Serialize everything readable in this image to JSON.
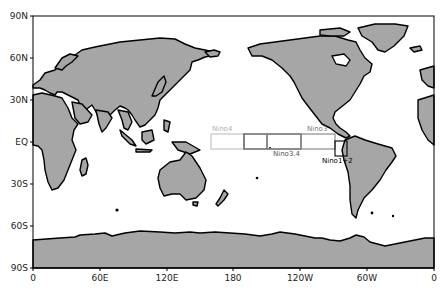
{
  "map": {
    "projection": "cylindrical-equidistant, centered 180",
    "land_color": "#a6a6a6",
    "ocean_color": "#ffffff",
    "coast_color": "#000000",
    "y_ticks": [
      "90N",
      "60N",
      "30N",
      "EQ",
      "30S",
      "60S",
      "90S"
    ],
    "x_ticks": [
      "0",
      "60E",
      "120E",
      "180",
      "120W",
      "60W",
      "0"
    ]
  },
  "regions": [
    {
      "name": "Nino4",
      "label": "Nino4",
      "lon": "160E-150W",
      "lat": "5S-5N",
      "color": "#bdbdbd"
    },
    {
      "name": "Nino3.4",
      "label": "Nino3.4",
      "lon": "170W-120W",
      "lat": "5S-5N",
      "color": "#7a7a7a"
    },
    {
      "name": "Nino3",
      "label": "Nino3",
      "lon": "150W-90W",
      "lat": "5S-5N",
      "color": "#8a8a8a"
    },
    {
      "name": "Nino1+2",
      "label": "Nino1+2",
      "lon": "90W-80W",
      "lat": "10S-0",
      "color": "#000000"
    }
  ]
}
